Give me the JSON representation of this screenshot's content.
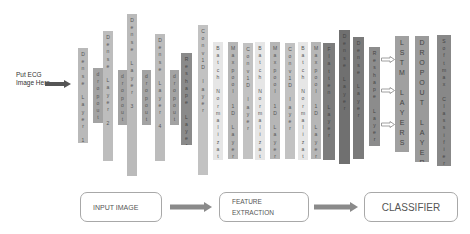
{
  "input": {
    "label": "Put ECG Image Here"
  },
  "layers": [
    {
      "label": "Dense Layer 1",
      "x": 78,
      "top": 48,
      "h": 95,
      "w": 10,
      "color": "#b9b9b9"
    },
    {
      "label": "dropout",
      "x": 93,
      "top": 68,
      "h": 55,
      "w": 10,
      "color": "#a3a3a3"
    },
    {
      "label": "Dense Layer 2",
      "x": 103,
      "top": 31,
      "h": 130,
      "w": 10,
      "color": "#bdbdbd"
    },
    {
      "label": "dropout",
      "x": 118,
      "top": 70,
      "h": 55,
      "w": 9,
      "color": "#a3a3a3"
    },
    {
      "label": "Dense Layer 3",
      "x": 127,
      "top": 14,
      "h": 162,
      "w": 10,
      "color": "#bababa"
    },
    {
      "label": "dropout",
      "x": 142,
      "top": 70,
      "h": 55,
      "w": 9,
      "color": "#a3a3a3"
    },
    {
      "label": "Dense Layer 4",
      "x": 155,
      "top": 34,
      "h": 127,
      "w": 10,
      "color": "#bcbcbc"
    },
    {
      "label": "dropout",
      "x": 170,
      "top": 70,
      "h": 55,
      "w": 9,
      "color": "#a3a3a3"
    },
    {
      "label": "Reshape Layer",
      "x": 181,
      "top": 53,
      "h": 92,
      "w": 11,
      "color": "#8a8a8a"
    },
    {
      "label": "Conv1D layer",
      "x": 198,
      "top": 25,
      "h": 150,
      "w": 10,
      "color": "#c2c2c2"
    },
    {
      "label": "Batch Normalization",
      "x": 213,
      "top": 42,
      "h": 118,
      "w": 10,
      "color": "#e6e6e6"
    },
    {
      "label": "Maxpool 1D Layer",
      "x": 228,
      "top": 42,
      "h": 117,
      "w": 10,
      "color": "#b6b6b6"
    },
    {
      "label": "Conv1D layer",
      "x": 243,
      "top": 43,
      "h": 116,
      "w": 10,
      "color": "#c2c2c2"
    },
    {
      "label": "Batch Normalization",
      "x": 255,
      "top": 42,
      "h": 118,
      "w": 10,
      "color": "#e6e6e6"
    },
    {
      "label": "Maxpool 1D Layer",
      "x": 270,
      "top": 42,
      "h": 117,
      "w": 10,
      "color": "#b6b6b6"
    },
    {
      "label": "Conv1D layer",
      "x": 285,
      "top": 43,
      "h": 116,
      "w": 10,
      "color": "#c2c2c2"
    },
    {
      "label": "Batch Normalization",
      "x": 298,
      "top": 42,
      "h": 118,
      "w": 10,
      "color": "#e6e6e6"
    },
    {
      "label": "Maxpool 1D Layer",
      "x": 311,
      "top": 42,
      "h": 117,
      "w": 10,
      "color": "#b6b6b6"
    },
    {
      "label": "Flatten Layer",
      "x": 323,
      "top": 43,
      "h": 117,
      "w": 12,
      "color": "#7c7c7c"
    },
    {
      "label": "Dense Layer",
      "x": 339,
      "top": 30,
      "h": 134,
      "w": 11,
      "color": "#707070"
    },
    {
      "label": "Dense Layer",
      "x": 353,
      "top": 37,
      "h": 122,
      "w": 11,
      "color": "#7a7a7a"
    },
    {
      "label": "Reshape Layer",
      "x": 369,
      "top": 47,
      "h": 99,
      "w": 11,
      "color": "#8c8c8c"
    },
    {
      "label": "LSTM LAYERS",
      "x": 395,
      "top": 36,
      "h": 116,
      "w": 14,
      "color": "#a0a0a0",
      "big": true
    },
    {
      "label": "DROPOUT LAYERS",
      "x": 415,
      "top": 36,
      "h": 126,
      "w": 14,
      "color": "#9a9a9a",
      "big": true
    },
    {
      "label": "Softmax Classifier",
      "x": 437,
      "top": 35,
      "h": 131,
      "w": 14,
      "color": "#888888"
    }
  ],
  "side_arrows": [
    {
      "x": 381,
      "y": 56
    },
    {
      "x": 381,
      "y": 87
    },
    {
      "x": 381,
      "y": 121
    }
  ],
  "flow": {
    "boxes": [
      {
        "label": "INPUT IMAGE",
        "x": 80,
        "y": 192,
        "w": 82,
        "h": 30,
        "font": 7
      },
      {
        "label": "FEATURE EXTRACTION",
        "x": 219,
        "y": 192,
        "w": 90,
        "h": 30,
        "font": 6.5
      },
      {
        "label": "CLASSIFIER",
        "x": 364,
        "y": 192,
        "w": 94,
        "h": 30,
        "font": 10
      }
    ],
    "arrows": [
      {
        "x": 170,
        "y": 202,
        "w": 42
      },
      {
        "x": 314,
        "y": 202,
        "w": 44
      }
    ]
  },
  "colors": {
    "arrow_fill": "#8a8a8a",
    "box_border": "#a8a8a8"
  }
}
